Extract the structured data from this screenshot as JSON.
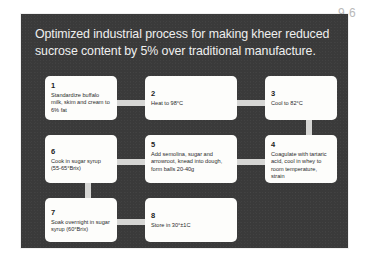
{
  "page": {
    "number_label": "9.6",
    "background_color": "#ffffff"
  },
  "slide": {
    "panel_color": "#3a3a3a",
    "title": "Optimized industrial process for making kheer reduced sucrose content by 5% over traditional manufacture.",
    "box_fill_color": "#fdfdfb",
    "connector_color": "#d6d6d4",
    "title_color": "#efefef"
  },
  "flowchart": {
    "type": "process-flow",
    "steps": [
      {
        "number": "1",
        "text": "Standardize buffalo milk, skim and cream to 6% fat"
      },
      {
        "number": "2",
        "text": "Heat to 98°C"
      },
      {
        "number": "3",
        "text": "Cool to 82°C"
      },
      {
        "number": "4",
        "text": "Coagulate with tartaric acid, cool in whey to room temperature, strain"
      },
      {
        "number": "5",
        "text": "Add semolina, sugar and arrowroot, knead into dough, form balls 20-40g"
      },
      {
        "number": "6",
        "text": "Cook in sugar syrup (55-65°Brix)"
      },
      {
        "number": "7",
        "text": "Soak overnight in sugar syrup (60°Brix)"
      },
      {
        "number": "8",
        "text": "Store in 30°±1C"
      }
    ]
  }
}
